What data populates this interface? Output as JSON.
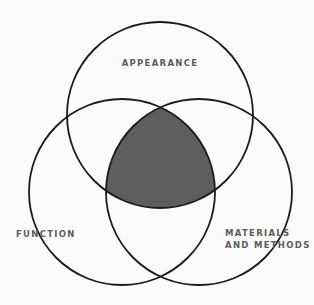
{
  "diagram": {
    "type": "venn",
    "sets": [
      {
        "id": "appearance",
        "label": "APPEARANCE"
      },
      {
        "id": "function",
        "label": "FUNCTION"
      },
      {
        "id": "materials",
        "label_line1": "MATERIALS",
        "label_line2": "AND METHODS"
      }
    ],
    "highlighted_region": "intersection of all three sets",
    "colors": {
      "background": "#fbfbfb",
      "stroke": "#1a1a1a",
      "shaded_intersection": "#5e5e5e",
      "label_text": "#5c5c5c"
    }
  }
}
